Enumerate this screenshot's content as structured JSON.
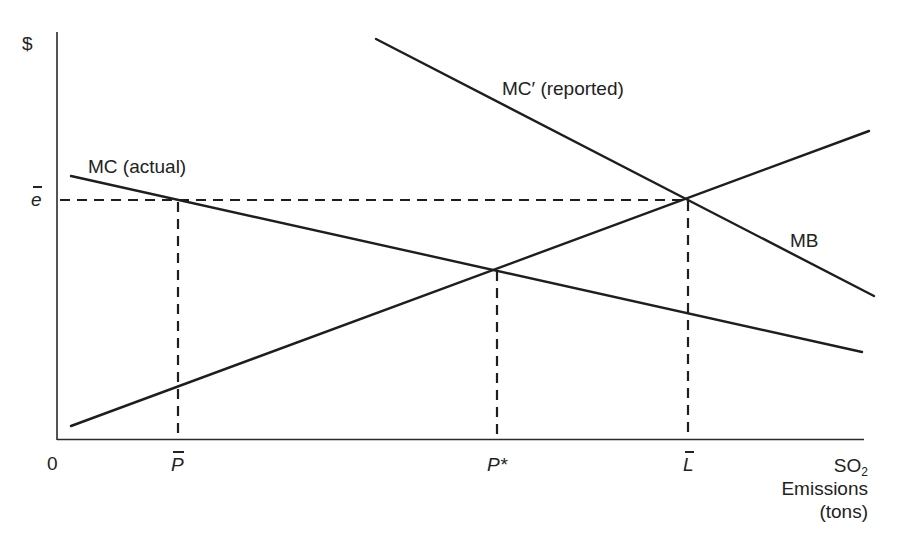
{
  "diagram": {
    "y_axis_label": "$",
    "origin_label": "0",
    "x_axis_label": {
      "line1_main": "SO",
      "line1_sub": "2",
      "line2": "Emissions",
      "line3": "(tons)"
    },
    "y_ticks": [
      {
        "label": "e",
        "overbar": true,
        "y_px": 200
      }
    ],
    "x_ticks": [
      {
        "label": "P",
        "overbar": true,
        "x_px": 178
      },
      {
        "label": "P*",
        "overbar": false,
        "x_px": 497
      },
      {
        "label": "L",
        "overbar": true,
        "x_px": 688
      }
    ],
    "curves": [
      {
        "name": "MC (actual)",
        "label": "MC (actual)",
        "from": [
          71,
          176
        ],
        "to": [
          862,
          352
        ],
        "style": "solid"
      },
      {
        "name": "MC′ (reported)",
        "label": "MC′ (reported)",
        "from": [
          376,
          39
        ],
        "to": [
          874,
          296
        ],
        "style": "solid"
      },
      {
        "name": "MB",
        "label": "MB",
        "from": [
          71,
          426
        ],
        "to": [
          869,
          131
        ],
        "style": "solid"
      }
    ],
    "guides": [
      {
        "name": "e-bar horizontal",
        "from": [
          58,
          200
        ],
        "to": [
          686,
          200
        ],
        "style": "dashed"
      },
      {
        "name": "P-bar vertical",
        "from": [
          178,
          200
        ],
        "to": [
          178,
          438
        ],
        "style": "dashed"
      },
      {
        "name": "P-star vertical",
        "from": [
          497,
          269
        ],
        "to": [
          497,
          438
        ],
        "style": "dashed"
      },
      {
        "name": "L-bar vertical",
        "from": [
          688,
          199
        ],
        "to": [
          688,
          438
        ],
        "style": "dashed"
      }
    ],
    "intersections": [
      {
        "name": "MC actual x MB",
        "at": [
          496,
          269
        ]
      },
      {
        "name": "MC reported x MB",
        "at": [
          686,
          199
        ]
      },
      {
        "name": "MC actual x e-bar",
        "at": [
          178,
          200
        ]
      }
    ],
    "colors": {
      "line": "#1e1e1e",
      "background": "#ffffff"
    }
  }
}
